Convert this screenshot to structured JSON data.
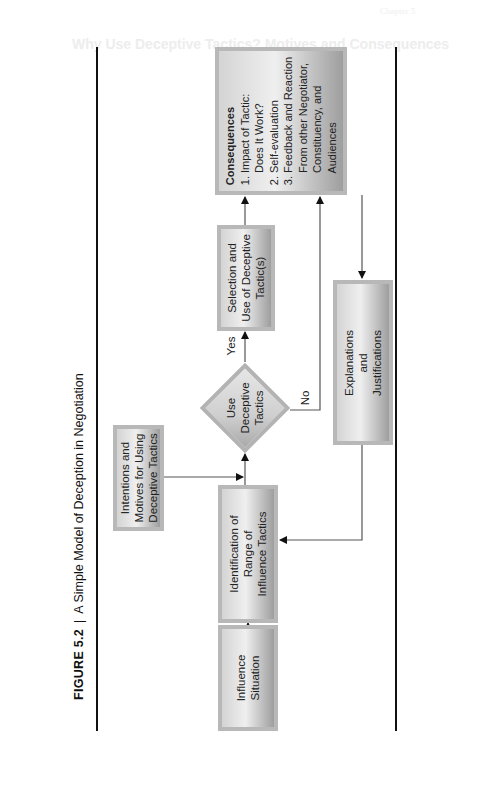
{
  "background": {
    "running_header": "Chapter 5",
    "section_heading": "Why Use Deceptive Tactics? Motives and Consequences",
    "subheading": "The Power Motive"
  },
  "figure": {
    "label": "FIGURE 5.2",
    "separator": "|",
    "title": "A Simple Model of Deception in Negotiation"
  },
  "nodes": {
    "influence_situation": {
      "lines": [
        "Influence",
        "Situation"
      ]
    },
    "identification": {
      "lines": [
        "Identification of",
        "Range of",
        "Influence Tactics"
      ]
    },
    "intentions": {
      "lines": [
        "Intentions and",
        "Motives for Using",
        "Deceptive Tactics"
      ]
    },
    "decision": {
      "lines": [
        "Use",
        "Deceptive",
        "Tactics"
      ]
    },
    "selection": {
      "lines": [
        "Selection and",
        "Use of Deceptive",
        "Tactic(s)"
      ]
    },
    "consequences": {
      "title": "Consequences",
      "items": [
        "1. Impact of Tactic:",
        "    Does It Work?",
        "2. Self-evaluation",
        "3. Feedback and Reaction",
        "    From other Negotiator,",
        "    Constituency, and",
        "    Audiences"
      ]
    },
    "explanations": {
      "lines": [
        "Explanations",
        "and",
        "Justifications"
      ]
    }
  },
  "edges": {
    "yes_label": "Yes",
    "no_label": "No"
  },
  "colors": {
    "line": "#3a3a3a",
    "frame": "#111111",
    "box_border": "#b8b8b8"
  }
}
